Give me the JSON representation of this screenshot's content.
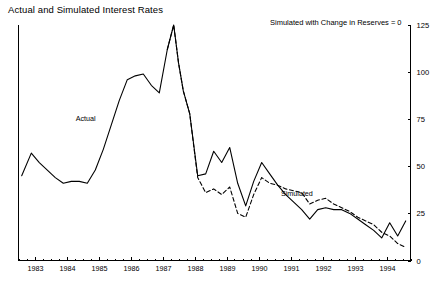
{
  "chart_data": {
    "type": "line",
    "title": "Actual and Simulated Interest Rates",
    "subtitle": "Simulated with Change in Reserves = 0",
    "xlabel": "",
    "ylabel": "",
    "ylim": [
      0,
      125
    ],
    "yticks": [
      0,
      25,
      50,
      75,
      100,
      125
    ],
    "ytick_labels": [
      "0",
      "25",
      "50",
      "75",
      "100",
      "125"
    ],
    "y_axis_position": "right",
    "grid": false,
    "legend": "inline-annotations",
    "xlim": [
      1982.5,
      1994.75
    ],
    "xticks": [
      1983,
      1984,
      1985,
      1986,
      1987,
      1988,
      1989,
      1990,
      1991,
      1992,
      1993,
      1994
    ],
    "xtick_labels": [
      "1983",
      "1984",
      "1985",
      "1986",
      "1987",
      "1988",
      "1989",
      "1990",
      "1991",
      "1992",
      "1993",
      "1994"
    ],
    "minor_xticks_per_year": 4,
    "annotations": [
      {
        "text": "Actual",
        "x": 1984.6,
        "y": 74
      },
      {
        "text": "Simulated",
        "x": 1991.2,
        "y": 34
      }
    ],
    "series": [
      {
        "name": "Actual",
        "style": "solid",
        "color": "#000000",
        "x": [
          1982.6,
          1982.9,
          1983.15,
          1983.4,
          1983.65,
          1983.9,
          1984.15,
          1984.4,
          1984.65,
          1984.9,
          1985.15,
          1985.4,
          1985.65,
          1985.9,
          1986.15,
          1986.4,
          1986.65,
          1986.9,
          1987.15,
          1987.35,
          1987.5,
          1987.65,
          1987.85,
          1988.1,
          1988.35,
          1988.6,
          1988.85,
          1989.1,
          1989.35,
          1989.6,
          1989.85,
          1990.1,
          1990.35,
          1990.6,
          1990.85,
          1991.1,
          1991.35,
          1991.6,
          1991.85,
          1992.1,
          1992.35,
          1992.6,
          1992.85,
          1993.1,
          1993.35,
          1993.6,
          1993.85,
          1994.1,
          1994.35,
          1994.6
        ],
        "y": [
          45,
          57,
          52,
          48,
          44,
          41,
          42,
          42,
          41,
          48,
          59,
          72,
          85,
          96,
          98,
          99,
          93,
          89,
          112,
          125,
          105,
          90,
          78,
          45,
          46,
          58,
          52,
          60,
          41,
          29,
          42,
          52,
          46,
          40,
          35,
          31,
          27,
          22,
          27,
          28,
          27,
          27,
          25,
          22,
          19,
          16,
          12,
          20,
          13,
          21
        ]
      },
      {
        "name": "Simulated",
        "style": "dashed",
        "color": "#000000",
        "x": [
          1987.15,
          1987.35,
          1987.5,
          1987.65,
          1987.85,
          1988.1,
          1988.35,
          1988.6,
          1988.85,
          1989.1,
          1989.35,
          1989.6,
          1989.85,
          1990.1,
          1990.35,
          1990.6,
          1990.85,
          1991.1,
          1991.35,
          1991.6,
          1991.85,
          1992.1,
          1992.35,
          1992.6,
          1992.85,
          1993.1,
          1993.35,
          1993.6,
          1993.85,
          1994.1,
          1994.35,
          1994.6
        ],
        "y": [
          112,
          125,
          105,
          90,
          78,
          44,
          36,
          38,
          35,
          39,
          25,
          23,
          35,
          44,
          41,
          40,
          38,
          37,
          36,
          30,
          32,
          33,
          30,
          28,
          26,
          23,
          21,
          19,
          15,
          13,
          9,
          7
        ]
      }
    ]
  }
}
